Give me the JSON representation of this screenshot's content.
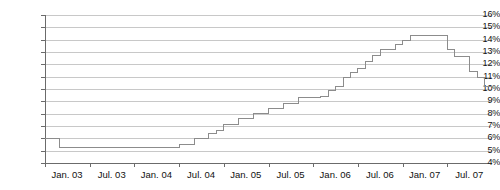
{
  "chart_data": {
    "type": "line",
    "line_style": "step",
    "title": "",
    "subtitle": "",
    "xlabel": "",
    "ylabel": "",
    "ylim": [
      4,
      16
    ],
    "ytick_labels": [
      "16%",
      "15%",
      "14%",
      "13%",
      "12%",
      "11%",
      "10%",
      "9%",
      "8%",
      "7%",
      "6%",
      "5%",
      "4%"
    ],
    "ytick_values": [
      16,
      15,
      14,
      13,
      12,
      11,
      10,
      9,
      8,
      7,
      6,
      5,
      4
    ],
    "ytick_suffix": "%",
    "xtick_labels": [
      "Jan. 03",
      "Jul. 03",
      "Jan. 04",
      "Jul. 04",
      "Jan. 05",
      "Jul. 05",
      "Jan. 06",
      "Jul. 06",
      "Jan. 07",
      "Jul. 07"
    ],
    "grid": true,
    "grid_axis": "y",
    "legend": "none",
    "x": [
      "Jan. 03",
      "Feb. 03",
      "Mar. 03",
      "Apr. 03",
      "May 03",
      "Jun. 03",
      "Jul. 03",
      "Aug. 03",
      "Sep. 03",
      "Oct. 03",
      "Nov. 03",
      "Dec. 03",
      "Jan. 04",
      "Feb. 04",
      "Mar. 04",
      "Apr. 04",
      "May 04",
      "Jun. 04",
      "Jul. 04",
      "Aug. 04",
      "Sep. 04",
      "Oct. 04",
      "Nov. 04",
      "Dec. 04",
      "Jan. 05",
      "Feb. 05",
      "Mar. 05",
      "Apr. 05",
      "May 05",
      "Jun. 05",
      "Jul. 05",
      "Aug. 05",
      "Sep. 05",
      "Oct. 05",
      "Nov. 05",
      "Dec. 05",
      "Jan. 06",
      "Feb. 06",
      "Mar. 06",
      "Apr. 06",
      "May 06",
      "Jun. 06",
      "Jul. 06",
      "Aug. 06",
      "Sep. 06",
      "Oct. 06",
      "Nov. 06",
      "Dec. 06",
      "Jan. 07",
      "Feb. 07",
      "Mar. 07",
      "Apr. 07",
      "May 07",
      "Jun. 07",
      "Jul. 07",
      "Aug. 07",
      "Sep. 07",
      "Oct. 07",
      "Nov. 07",
      "Dec. 07"
    ],
    "values": [
      6.0,
      6.0,
      5.25,
      5.25,
      5.25,
      5.25,
      5.25,
      5.25,
      5.25,
      5.25,
      5.25,
      5.25,
      5.25,
      5.25,
      5.25,
      5.25,
      5.25,
      5.25,
      5.5,
      5.5,
      6.0,
      6.0,
      6.4,
      6.6,
      7.1,
      7.1,
      7.6,
      7.6,
      8.0,
      8.0,
      8.4,
      8.4,
      8.8,
      8.8,
      9.3,
      9.3,
      9.3,
      9.4,
      9.9,
      10.2,
      10.9,
      11.3,
      11.7,
      12.2,
      12.7,
      13.2,
      13.2,
      13.6,
      13.9,
      14.3,
      14.3,
      14.3,
      14.3,
      14.3,
      13.2,
      12.6,
      12.6,
      11.4,
      10.9,
      10.2
    ],
    "series_color": "#8c8c8c",
    "grid_color": "#c8c8c8",
    "axis_color": "#6b6b6b",
    "text_color": "#111111",
    "background": "#ffffff"
  }
}
